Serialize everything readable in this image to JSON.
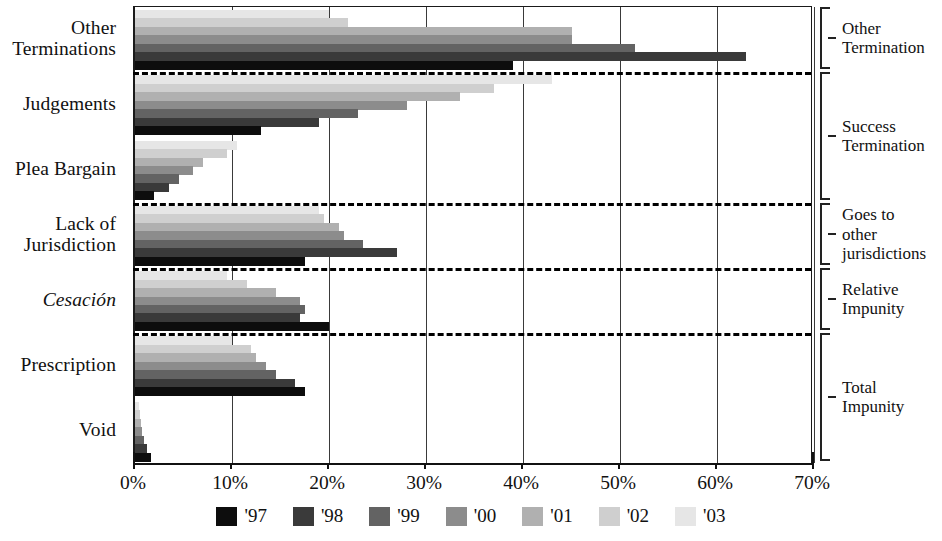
{
  "chart_data": {
    "type": "bar",
    "orientation": "horizontal",
    "title": "",
    "subtitle": "",
    "xlabel": "",
    "ylabel": "",
    "xlim": [
      0,
      70
    ],
    "xticks": [
      0,
      10,
      20,
      30,
      40,
      50,
      60,
      70
    ],
    "xtick_labels": [
      "0%",
      "10%",
      "20%",
      "30%",
      "40%",
      "50%",
      "60%",
      "70%"
    ],
    "grid": true,
    "grid_axis": "x",
    "legend_position": "bottom",
    "categories": [
      "Other Terminations",
      "Judgements",
      "Plea Bargain",
      "Lack of Jurisdiction",
      "Cesación",
      "Prescription",
      "Void"
    ],
    "series": [
      {
        "name": "'97",
        "color": "#0d0d0d",
        "values": [
          39.0,
          13.0,
          2.0,
          17.5,
          20.0,
          17.5,
          1.6
        ]
      },
      {
        "name": "'98",
        "color": "#3a3a3a",
        "values": [
          63.0,
          19.0,
          3.5,
          27.0,
          17.0,
          16.5,
          1.2
        ]
      },
      {
        "name": "'99",
        "color": "#636363",
        "values": [
          51.5,
          23.0,
          4.5,
          23.5,
          17.5,
          14.5,
          0.9
        ]
      },
      {
        "name": "'00",
        "color": "#8c8c8c",
        "values": [
          45.0,
          28.0,
          6.0,
          21.5,
          17.0,
          13.5,
          0.7
        ]
      },
      {
        "name": "'01",
        "color": "#b0b0b0",
        "values": [
          45.0,
          33.5,
          7.0,
          21.0,
          14.5,
          12.5,
          0.6
        ]
      },
      {
        "name": "'02",
        "color": "#cfcfcf",
        "values": [
          22.0,
          37.0,
          9.5,
          19.5,
          11.5,
          12.0,
          0.5
        ]
      },
      {
        "name": "'03",
        "color": "#e6e6e6",
        "values": [
          20.0,
          43.0,
          10.5,
          19.0,
          9.5,
          10.0,
          0.4
        ]
      }
    ],
    "series_draw_order_top_to_bottom": [
      "'03",
      "'02",
      "'01",
      "'00",
      "'99",
      "'98",
      "'97"
    ],
    "group_separators_after": [
      "Other Terminations",
      "Plea Bargain",
      "Lack of Jurisdiction",
      "Cesación"
    ]
  },
  "axis": {
    "x_tick_labels": [
      "0%",
      "10%",
      "20%",
      "30%",
      "40%",
      "50%",
      "60%",
      "70%"
    ]
  },
  "category_labels": [
    {
      "text": "Other\nTerminations",
      "italic": false
    },
    {
      "text": "Judgements",
      "italic": false
    },
    {
      "text": "Plea Bargain",
      "italic": false
    },
    {
      "text": "Lack of\nJurisdiction",
      "italic": false
    },
    {
      "text": "Cesación",
      "italic": true
    },
    {
      "text": "Prescription",
      "italic": false
    },
    {
      "text": "Void",
      "italic": false
    }
  ],
  "right_groups": [
    {
      "label": "Other\nTermination"
    },
    {
      "label": "Success\nTermination"
    },
    {
      "label": "Goes to\nother\njurisdictions"
    },
    {
      "label": "Relative\nImpunity"
    },
    {
      "label": "Total\nImpunity"
    }
  ],
  "legend": {
    "items": [
      {
        "label": "'97",
        "color": "#0d0d0d"
      },
      {
        "label": "'98",
        "color": "#3a3a3a"
      },
      {
        "label": "'99",
        "color": "#636363"
      },
      {
        "label": "'00",
        "color": "#8c8c8c"
      },
      {
        "label": "'01",
        "color": "#b0b0b0"
      },
      {
        "label": "'02",
        "color": "#cfcfcf"
      },
      {
        "label": "'03",
        "color": "#e6e6e6"
      }
    ]
  }
}
